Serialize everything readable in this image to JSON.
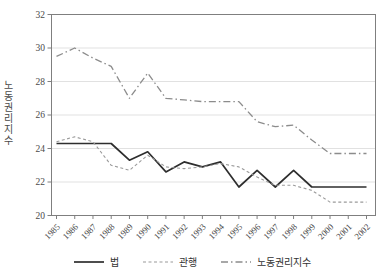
{
  "chart_data": {
    "type": "line",
    "title": "",
    "ylabel": "노동권리지수",
    "xlabel": "",
    "ylim": [
      20,
      32
    ],
    "ytick_step": 2,
    "grid": "horizontal",
    "legend_position": "bottom",
    "x": [
      1985,
      1986,
      1987,
      1988,
      1989,
      1990,
      1991,
      1992,
      1993,
      1994,
      1995,
      1996,
      1997,
      1998,
      1999,
      2000,
      2001,
      2002
    ],
    "series": [
      {
        "key": "law",
        "name": "법",
        "style": "solid",
        "color": "#2e2e2e",
        "values": [
          24.3,
          24.3,
          24.3,
          24.3,
          23.3,
          23.8,
          22.6,
          23.2,
          22.9,
          23.2,
          21.7,
          22.7,
          21.7,
          22.7,
          21.7,
          21.7,
          21.7,
          21.7
        ]
      },
      {
        "key": "practice",
        "name": "관행",
        "style": "dashed",
        "color": "#9a9a9a",
        "values": [
          24.4,
          24.7,
          24.4,
          23.0,
          22.7,
          23.6,
          22.9,
          22.8,
          22.9,
          23.1,
          22.9,
          22.3,
          21.8,
          21.8,
          21.5,
          20.8,
          20.8,
          20.8
        ]
      },
      {
        "key": "index",
        "name": "노동권리지수",
        "style": "dashdot",
        "color": "#8c8c8c",
        "values": [
          29.5,
          30.0,
          29.4,
          28.9,
          27.0,
          28.5,
          27.0,
          26.9,
          26.8,
          26.8,
          26.8,
          25.6,
          25.3,
          25.4,
          24.5,
          23.7,
          23.7,
          23.7
        ]
      }
    ],
    "colors": {
      "frame": "#7f7f7f",
      "grid": "#d9d9d9",
      "tick_label": "#4a4a4a",
      "background": "#ffffff"
    }
  }
}
